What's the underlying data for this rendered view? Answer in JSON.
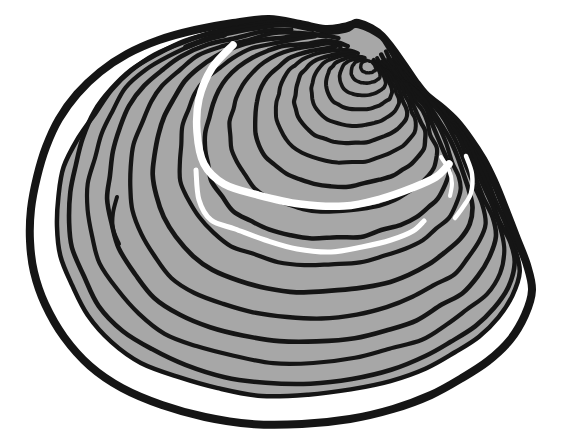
{
  "figure": {
    "name": "clam-shell",
    "canvas": {
      "w": 563,
      "h": 444
    },
    "colors": {
      "background": "#ffffff",
      "ink": "#151515",
      "shell_gray": "#a7a7a7",
      "margin_white": "#ffffff",
      "highlight": "#ffffff"
    },
    "umbo": [
      371,
      62
    ],
    "outline": {
      "stroke_width": 8,
      "points": [
        [
          358,
          23
        ],
        [
          371,
          28
        ],
        [
          382,
          36
        ],
        [
          391,
          47
        ],
        [
          399,
          58
        ],
        [
          408,
          71
        ],
        [
          417,
          84
        ],
        [
          427,
          96
        ],
        [
          441,
          107
        ],
        [
          456,
          121
        ],
        [
          470,
          139
        ],
        [
          483,
          159
        ],
        [
          494,
          181
        ],
        [
          505,
          208
        ],
        [
          517,
          239
        ],
        [
          527,
          265
        ],
        [
          532,
          290
        ],
        [
          525,
          315
        ],
        [
          510,
          340
        ],
        [
          488,
          361
        ],
        [
          462,
          378
        ],
        [
          431,
          395
        ],
        [
          393,
          409
        ],
        [
          350,
          419
        ],
        [
          302,
          424
        ],
        [
          252,
          424
        ],
        [
          205,
          417
        ],
        [
          162,
          405
        ],
        [
          122,
          388
        ],
        [
          90,
          366
        ],
        [
          64,
          337
        ],
        [
          45,
          304
        ],
        [
          34,
          272
        ],
        [
          30,
          241
        ],
        [
          31,
          209
        ],
        [
          37,
          177
        ],
        [
          46,
          147
        ],
        [
          59,
          119
        ],
        [
          77,
          94
        ],
        [
          100,
          72
        ],
        [
          127,
          54
        ],
        [
          159,
          40
        ],
        [
          195,
          30
        ],
        [
          233,
          23
        ],
        [
          269,
          19
        ],
        [
          300,
          24
        ],
        [
          325,
          29
        ],
        [
          343,
          27
        ],
        [
          353,
          24
        ]
      ]
    },
    "body": {
      "scale": 0.92,
      "stroke_width": 4.5,
      "inset_boost": 0.035,
      "boost_full_indices": [
        37,
        38,
        39,
        40,
        41
      ],
      "boost_half_indices": [
        36,
        42
      ]
    },
    "rings": [
      {
        "t": 0.885,
        "w": 4.6
      },
      {
        "t": 0.83,
        "w": 4.2
      },
      {
        "t": 0.772,
        "w": 4.6
      },
      {
        "t": 0.708,
        "w": 4.3
      },
      {
        "t": 0.636,
        "w": 4.7
      },
      {
        "t": 0.562,
        "w": 4.2
      },
      {
        "t": 0.487,
        "w": 4.5
      },
      {
        "t": 0.413,
        "w": 4.2
      },
      {
        "t": 0.342,
        "w": 4.4
      },
      {
        "t": 0.278,
        "w": 4.0
      },
      {
        "t": 0.224,
        "w": 4.2
      },
      {
        "t": 0.175,
        "w": 3.9
      },
      {
        "t": 0.131,
        "w": 4.0
      },
      {
        "t": 0.092,
        "w": 3.7
      },
      {
        "t": 0.058,
        "w": 3.6
      },
      {
        "t": 0.03,
        "w": 3.4
      }
    ],
    "highlights": [
      {
        "name": "highlight-band-upper",
        "w": 7.5,
        "points": [
          [
            233,
            45
          ],
          [
            212,
            68
          ],
          [
            199,
            99
          ],
          [
            197,
            132
          ],
          [
            204,
            164
          ],
          [
            224,
            184
          ],
          [
            258,
            195
          ],
          [
            300,
            204
          ],
          [
            344,
            206
          ],
          [
            380,
            199
          ],
          [
            412,
            188
          ],
          [
            436,
            177
          ],
          [
            449,
            164
          ]
        ]
      },
      {
        "name": "highlight-band-lower",
        "w": 5,
        "points": [
          [
            196,
            170
          ],
          [
            199,
            200
          ],
          [
            211,
            220
          ],
          [
            235,
            229
          ],
          [
            265,
            240
          ],
          [
            297,
            249
          ],
          [
            331,
            252
          ],
          [
            362,
            247
          ],
          [
            391,
            240
          ],
          [
            413,
            231
          ],
          [
            424,
            221
          ]
        ]
      },
      {
        "name": "highlight-arc-right-inner",
        "w": 4,
        "points": [
          [
            441,
            157
          ],
          [
            449,
            170
          ],
          [
            452,
            183
          ],
          [
            450,
            196
          ]
        ]
      },
      {
        "name": "highlight-arc-right-outer",
        "w": 4.5,
        "points": [
          [
            466,
            156
          ],
          [
            472,
            174
          ],
          [
            471,
            193
          ],
          [
            463,
            207
          ],
          [
            455,
            218
          ]
        ]
      }
    ],
    "ink_dashes": [
      {
        "name": "ink-dash-top-left",
        "w": 5.5,
        "points": [
          [
            186,
            47
          ],
          [
            199,
            42
          ],
          [
            211,
            38
          ],
          [
            224,
            35
          ]
        ]
      },
      {
        "name": "ink-dash-left-middle",
        "w": 4,
        "points": [
          [
            117,
            197
          ],
          [
            113,
            213
          ],
          [
            113,
            229
          ],
          [
            119,
            244
          ]
        ]
      }
    ]
  }
}
